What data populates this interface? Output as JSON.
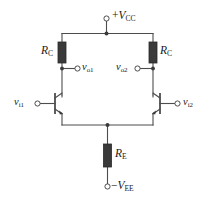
{
  "figure": {
    "type": "circuit-schematic",
    "background_color": "#ffffff",
    "wire_color": "#4d4d4d",
    "component_fill": "#3a3a3a",
    "label_color": "#1a1a1a"
  },
  "labels": {
    "supply_positive": {
      "sign": "+",
      "symbol": "V",
      "subscript": "CC",
      "text": "+V_CC"
    },
    "supply_negative": {
      "sign": "−",
      "symbol": "V",
      "subscript": "EE",
      "text": "-V_EE"
    },
    "resistor_collector_left": {
      "symbol": "R",
      "subscript": "C",
      "text": "R_C"
    },
    "resistor_collector_right": {
      "symbol": "R",
      "subscript": "C",
      "text": "R_C"
    },
    "resistor_emitter": {
      "symbol": "R",
      "subscript": "E",
      "text": "R_E"
    },
    "output_left": {
      "symbol": "v",
      "subscript": "o1",
      "text": "v_o1"
    },
    "output_right": {
      "symbol": "v",
      "subscript": "o2",
      "text": "v_o2"
    },
    "input_left": {
      "symbol": "v",
      "subscript": "i1",
      "text": "v_i1"
    },
    "input_right": {
      "symbol": "v",
      "subscript": "i2",
      "text": "v_i2"
    }
  },
  "components": {
    "transistor_left": {
      "name": "Q1",
      "type": "npn-bjt",
      "orientation": "base-left"
    },
    "transistor_right": {
      "name": "Q2",
      "type": "npn-bjt",
      "orientation": "base-right"
    },
    "terminals": [
      {
        "name": "vcc-terminal",
        "style": "open-circle"
      },
      {
        "name": "vee-terminal",
        "style": "open-circle"
      },
      {
        "name": "vo1-terminal",
        "style": "open-circle"
      },
      {
        "name": "vo2-terminal",
        "style": "open-circle"
      },
      {
        "name": "vi1-terminal",
        "style": "open-circle"
      },
      {
        "name": "vi2-terminal",
        "style": "open-circle"
      }
    ],
    "junction_dots": [
      {
        "name": "vcc-node"
      },
      {
        "name": "vo1-node"
      },
      {
        "name": "vo2-node"
      },
      {
        "name": "emitter-node"
      }
    ]
  }
}
